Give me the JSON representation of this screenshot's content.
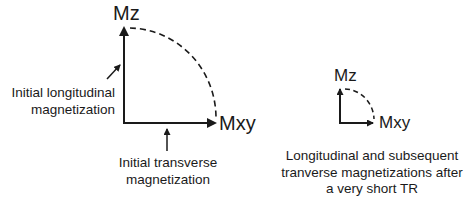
{
  "diagram": {
    "left_panel": {
      "axis_vertical_label": "Mz",
      "axis_horizontal_label": "Mxy",
      "annotation_longitudinal": [
        "Initial longitudinal",
        "magnetization"
      ],
      "annotation_transverse": [
        "Initial transverse",
        "magnetization"
      ]
    },
    "right_panel": {
      "axis_vertical_label": "Mz",
      "axis_horizontal_label": "Mxy",
      "caption": [
        "Longitudinal and subsequent",
        "tranverse magnetizations after",
        "a very short TR"
      ]
    },
    "colors": {
      "stroke": "#1a1a1a",
      "background": "#ffffff"
    }
  }
}
